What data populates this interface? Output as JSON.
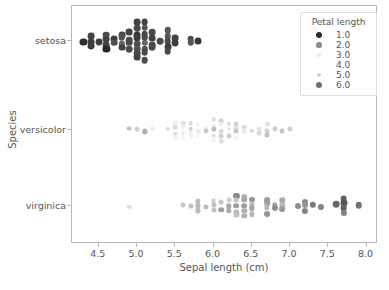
{
  "chart_data": {
    "type": "scatter",
    "title": "",
    "xlabel": "Sepal length (cm)",
    "ylabel": "Species",
    "xlim": [
      4.15,
      8.15
    ],
    "ylim_categories": [
      "setosa",
      "versicolor",
      "virginica"
    ],
    "xticks": [
      4.5,
      5.0,
      5.5,
      6.0,
      6.5,
      7.0,
      7.5,
      8.0
    ],
    "xticklabels": [
      "4.5",
      "5.0",
      "5.5",
      "6.0",
      "6.5",
      "7.0",
      "7.5",
      "8.0"
    ],
    "yticklabels": [
      "setosa",
      "versicolor",
      "virginica"
    ],
    "grid": false,
    "legend": {
      "title": "Petal length",
      "position": "upper right",
      "entries": [
        {
          "label": "1.0",
          "color": "#2b2b2b",
          "size": 3.0
        },
        {
          "label": "2.0",
          "color": "#8d8d8d",
          "size": 2.6
        },
        {
          "label": "3.0",
          "color": "#e8e8e8",
          "size": 2.2
        },
        {
          "label": "4.0",
          "color": "#ffffff",
          "size": 1.8
        },
        {
          "label": "5.0",
          "color": "#d2d2d2",
          "size": 2.4
        },
        {
          "label": "6.0",
          "color": "#6f6f6f",
          "size": 3.0
        }
      ]
    },
    "hue_variable": "Petal length",
    "hue_range": [
      1.0,
      6.9
    ],
    "series": [
      {
        "name": "setosa",
        "y_category": "setosa",
        "points": [
          {
            "x": 4.3,
            "petal_length": 1.1
          },
          {
            "x": 4.4,
            "petal_length": 1.4
          },
          {
            "x": 4.4,
            "petal_length": 1.3
          },
          {
            "x": 4.4,
            "petal_length": 1.3
          },
          {
            "x": 4.5,
            "petal_length": 1.3
          },
          {
            "x": 4.6,
            "petal_length": 1.5
          },
          {
            "x": 4.6,
            "petal_length": 1.4
          },
          {
            "x": 4.6,
            "petal_length": 1.4
          },
          {
            "x": 4.6,
            "petal_length": 1.0
          },
          {
            "x": 4.7,
            "petal_length": 1.3
          },
          {
            "x": 4.7,
            "petal_length": 1.6
          },
          {
            "x": 4.8,
            "petal_length": 1.4
          },
          {
            "x": 4.8,
            "petal_length": 1.6
          },
          {
            "x": 4.8,
            "petal_length": 1.9
          },
          {
            "x": 4.9,
            "petal_length": 1.4
          },
          {
            "x": 4.9,
            "petal_length": 1.5
          },
          {
            "x": 4.9,
            "petal_length": 1.5
          },
          {
            "x": 5.0,
            "petal_length": 1.4
          },
          {
            "x": 5.0,
            "petal_length": 1.5
          },
          {
            "x": 5.0,
            "petal_length": 1.2
          },
          {
            "x": 5.0,
            "petal_length": 1.3
          },
          {
            "x": 5.0,
            "petal_length": 1.6
          },
          {
            "x": 5.0,
            "petal_length": 1.6
          },
          {
            "x": 5.0,
            "petal_length": 1.5
          },
          {
            "x": 5.1,
            "petal_length": 1.4
          },
          {
            "x": 5.1,
            "petal_length": 1.7
          },
          {
            "x": 5.1,
            "petal_length": 1.5
          },
          {
            "x": 5.1,
            "petal_length": 1.5
          },
          {
            "x": 5.1,
            "petal_length": 1.9
          },
          {
            "x": 5.1,
            "petal_length": 1.6
          },
          {
            "x": 5.1,
            "petal_length": 1.5
          },
          {
            "x": 5.1,
            "petal_length": 1.5
          },
          {
            "x": 5.2,
            "petal_length": 1.5
          },
          {
            "x": 5.2,
            "petal_length": 1.4
          },
          {
            "x": 5.2,
            "petal_length": 1.5
          },
          {
            "x": 5.3,
            "petal_length": 1.5
          },
          {
            "x": 5.4,
            "petal_length": 1.7
          },
          {
            "x": 5.4,
            "petal_length": 1.7
          },
          {
            "x": 5.4,
            "petal_length": 1.5
          },
          {
            "x": 5.4,
            "petal_length": 1.3
          },
          {
            "x": 5.4,
            "petal_length": 1.5
          },
          {
            "x": 5.5,
            "petal_length": 1.4
          },
          {
            "x": 5.5,
            "petal_length": 1.3
          },
          {
            "x": 5.7,
            "petal_length": 1.5
          },
          {
            "x": 5.7,
            "petal_length": 1.7
          },
          {
            "x": 5.8,
            "petal_length": 1.2
          },
          {
            "x": 4.9,
            "petal_length": 1.5
          },
          {
            "x": 4.8,
            "petal_length": 1.4
          },
          {
            "x": 5.0,
            "petal_length": 1.4
          },
          {
            "x": 5.2,
            "petal_length": 1.5
          }
        ]
      },
      {
        "name": "versicolor",
        "y_category": "versicolor",
        "points": [
          {
            "x": 4.9,
            "petal_length": 3.3
          },
          {
            "x": 5.0,
            "petal_length": 3.5
          },
          {
            "x": 5.1,
            "petal_length": 3.0
          },
          {
            "x": 5.2,
            "petal_length": 3.9
          },
          {
            "x": 5.4,
            "petal_length": 4.5
          },
          {
            "x": 5.5,
            "petal_length": 4.0
          },
          {
            "x": 5.5,
            "petal_length": 3.7
          },
          {
            "x": 5.5,
            "petal_length": 4.4
          },
          {
            "x": 5.5,
            "petal_length": 4.0
          },
          {
            "x": 5.6,
            "petal_length": 4.5
          },
          {
            "x": 5.6,
            "petal_length": 3.9
          },
          {
            "x": 5.6,
            "petal_length": 4.2
          },
          {
            "x": 5.6,
            "petal_length": 4.1
          },
          {
            "x": 5.7,
            "petal_length": 4.5
          },
          {
            "x": 5.7,
            "petal_length": 3.5
          },
          {
            "x": 5.7,
            "petal_length": 4.2
          },
          {
            "x": 5.7,
            "petal_length": 4.1
          },
          {
            "x": 5.8,
            "petal_length": 4.0
          },
          {
            "x": 5.8,
            "petal_length": 3.9
          },
          {
            "x": 5.8,
            "petal_length": 4.1
          },
          {
            "x": 5.9,
            "petal_length": 4.2
          },
          {
            "x": 5.9,
            "petal_length": 4.8
          },
          {
            "x": 6.0,
            "petal_length": 4.5
          },
          {
            "x": 6.0,
            "petal_length": 4.0
          },
          {
            "x": 6.0,
            "petal_length": 5.1
          },
          {
            "x": 6.0,
            "petal_length": 4.5
          },
          {
            "x": 6.1,
            "petal_length": 4.7
          },
          {
            "x": 6.1,
            "petal_length": 4.0
          },
          {
            "x": 6.1,
            "petal_length": 4.6
          },
          {
            "x": 6.1,
            "petal_length": 4.7
          },
          {
            "x": 6.2,
            "petal_length": 4.5
          },
          {
            "x": 6.2,
            "petal_length": 4.3
          },
          {
            "x": 6.3,
            "petal_length": 4.7
          },
          {
            "x": 6.3,
            "petal_length": 4.4
          },
          {
            "x": 6.3,
            "petal_length": 4.9
          },
          {
            "x": 6.4,
            "petal_length": 4.5
          },
          {
            "x": 6.4,
            "petal_length": 4.3
          },
          {
            "x": 6.5,
            "petal_length": 4.6
          },
          {
            "x": 6.6,
            "petal_length": 4.4
          },
          {
            "x": 6.6,
            "petal_length": 4.6
          },
          {
            "x": 6.7,
            "petal_length": 4.4
          },
          {
            "x": 6.7,
            "petal_length": 4.7
          },
          {
            "x": 6.7,
            "petal_length": 5.0
          },
          {
            "x": 6.8,
            "petal_length": 4.8
          },
          {
            "x": 6.9,
            "petal_length": 4.9
          },
          {
            "x": 7.0,
            "petal_length": 4.7
          },
          {
            "x": 6.0,
            "petal_length": 4.0
          },
          {
            "x": 6.1,
            "petal_length": 4.4
          },
          {
            "x": 6.2,
            "petal_length": 4.8
          },
          {
            "x": 6.3,
            "petal_length": 4.1
          }
        ]
      },
      {
        "name": "virginica",
        "y_category": "virginica",
        "points": [
          {
            "x": 4.9,
            "petal_length": 4.5
          },
          {
            "x": 5.6,
            "petal_length": 4.9
          },
          {
            "x": 5.7,
            "petal_length": 5.0
          },
          {
            "x": 5.8,
            "petal_length": 5.1
          },
          {
            "x": 5.8,
            "petal_length": 5.1
          },
          {
            "x": 5.8,
            "petal_length": 5.1
          },
          {
            "x": 5.9,
            "petal_length": 5.1
          },
          {
            "x": 6.0,
            "petal_length": 4.8
          },
          {
            "x": 6.0,
            "petal_length": 5.0
          },
          {
            "x": 6.1,
            "petal_length": 4.9
          },
          {
            "x": 6.1,
            "petal_length": 5.6
          },
          {
            "x": 6.2,
            "petal_length": 4.8
          },
          {
            "x": 6.2,
            "petal_length": 5.4
          },
          {
            "x": 6.3,
            "petal_length": 6.0
          },
          {
            "x": 6.3,
            "petal_length": 4.9
          },
          {
            "x": 6.3,
            "petal_length": 5.6
          },
          {
            "x": 6.3,
            "petal_length": 5.1
          },
          {
            "x": 6.3,
            "petal_length": 5.0
          },
          {
            "x": 6.4,
            "petal_length": 5.3
          },
          {
            "x": 6.4,
            "petal_length": 5.5
          },
          {
            "x": 6.4,
            "petal_length": 5.6
          },
          {
            "x": 6.4,
            "petal_length": 5.3
          },
          {
            "x": 6.5,
            "petal_length": 5.8
          },
          {
            "x": 6.5,
            "petal_length": 5.1
          },
          {
            "x": 6.5,
            "petal_length": 5.5
          },
          {
            "x": 6.5,
            "petal_length": 5.2
          },
          {
            "x": 6.7,
            "petal_length": 5.7
          },
          {
            "x": 6.7,
            "petal_length": 5.6
          },
          {
            "x": 6.7,
            "petal_length": 5.2
          },
          {
            "x": 6.7,
            "petal_length": 5.8
          },
          {
            "x": 6.8,
            "petal_length": 5.5
          },
          {
            "x": 6.8,
            "petal_length": 5.9
          },
          {
            "x": 6.9,
            "petal_length": 5.4
          },
          {
            "x": 6.9,
            "petal_length": 5.1
          },
          {
            "x": 6.9,
            "petal_length": 5.7
          },
          {
            "x": 7.1,
            "petal_length": 5.9
          },
          {
            "x": 7.2,
            "petal_length": 6.0
          },
          {
            "x": 7.2,
            "petal_length": 5.8
          },
          {
            "x": 7.2,
            "petal_length": 6.1
          },
          {
            "x": 7.3,
            "petal_length": 6.3
          },
          {
            "x": 7.4,
            "petal_length": 6.1
          },
          {
            "x": 7.6,
            "petal_length": 6.6
          },
          {
            "x": 7.7,
            "petal_length": 6.7
          },
          {
            "x": 7.7,
            "petal_length": 6.9
          },
          {
            "x": 7.7,
            "petal_length": 6.7
          },
          {
            "x": 7.7,
            "petal_length": 6.1
          },
          {
            "x": 7.9,
            "petal_length": 6.4
          },
          {
            "x": 6.0,
            "petal_length": 5.0
          },
          {
            "x": 6.2,
            "petal_length": 5.4
          },
          {
            "x": 6.4,
            "petal_length": 5.3
          }
        ]
      }
    ]
  },
  "caption": "",
  "colors": {
    "axis": "#b8b8b8",
    "text": "#555555",
    "background": "#ffffff"
  }
}
